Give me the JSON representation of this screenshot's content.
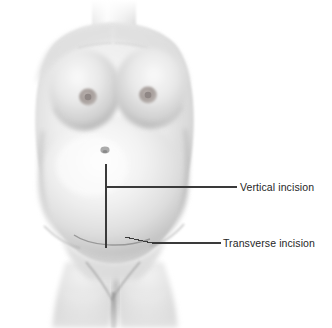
{
  "figure": {
    "background_color": "#ffffff",
    "width": 332,
    "height": 328
  },
  "annotations": {
    "leader_line_color": "#3a3a3a",
    "text_color": "#262626",
    "items": [
      {
        "id": "vertical",
        "label": "Vertical incision",
        "incision_type": "midline vertical",
        "marker_orientation": "vertical",
        "label_x": 240,
        "label_y": 181
      },
      {
        "id": "transverse",
        "label": "Transverse incision",
        "incision_type": "low transverse (Pfannenstiel)",
        "marker_orientation": "horizontal arc",
        "label_x": 223,
        "label_y": 237
      }
    ]
  },
  "anatomy": {
    "skin_light": "#f7f7f7",
    "skin_mid": "#dcdcdc",
    "skin_shadow": "#b4b4b4",
    "skin_deep": "#9a9a9a",
    "areola_color": "#a09a98",
    "parts": [
      {
        "name": "neck",
        "center_x": 113
      },
      {
        "name": "shoulders",
        "top_y": 25
      },
      {
        "name": "left-breast",
        "areola_x": 88,
        "areola_y": 97
      },
      {
        "name": "right-breast",
        "areola_x": 148,
        "areola_y": 95
      },
      {
        "name": "gravid-abdomen",
        "widest_left_x": 42,
        "widest_right_x": 188
      },
      {
        "name": "umbilicus",
        "x": 105,
        "y": 150
      },
      {
        "name": "pelvis"
      },
      {
        "name": "thighs",
        "cleft_x": 115
      }
    ]
  }
}
